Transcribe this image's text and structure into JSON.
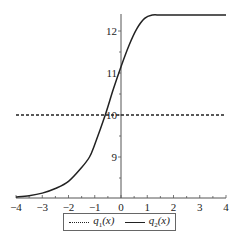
{
  "chart_data": {
    "type": "line",
    "title": "",
    "xlabel": "",
    "ylabel": "",
    "xlim": [
      -4,
      4
    ],
    "ylim": [
      8.0,
      12.4
    ],
    "x_ticks": [
      -4,
      -3,
      -2,
      -1,
      0,
      1,
      2,
      3,
      4
    ],
    "y_ticks": [
      9,
      10,
      11,
      12
    ],
    "grid": false,
    "legend_position": "bottom",
    "series": [
      {
        "name": "q1(x)",
        "style": "dotted",
        "x": [
          -4,
          4
        ],
        "values": [
          10,
          10
        ]
      },
      {
        "name": "q2(x)",
        "style": "solid",
        "x": [
          -4,
          -3.5,
          -3,
          -2.5,
          -2,
          -1.5,
          -1.2,
          -1,
          -0.6,
          -0.3,
          0,
          0.3,
          0.6,
          0.9,
          1.2,
          1.5,
          2,
          3,
          4
        ],
        "values": [
          8.05,
          8.08,
          8.14,
          8.25,
          8.42,
          8.75,
          9.0,
          9.3,
          10.0,
          10.6,
          11.15,
          11.65,
          12.05,
          12.3,
          12.38,
          12.38,
          12.38,
          12.38,
          12.38
        ]
      }
    ]
  },
  "legend": {
    "items": [
      {
        "label_base": "q",
        "label_sub": "1",
        "label_arg": "(x)"
      },
      {
        "label_base": "q",
        "label_sub": "2",
        "label_arg": "(x)"
      }
    ]
  },
  "axis_labels": {
    "x": [
      "-4",
      "-3",
      "-2",
      "-1",
      "0",
      "1",
      "2",
      "3",
      "4"
    ],
    "y": [
      "9",
      "10",
      "11",
      "12"
    ]
  }
}
